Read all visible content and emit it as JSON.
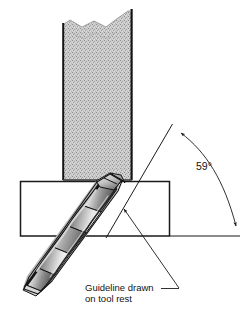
{
  "figure": {
    "background_color": "#ffffff",
    "line_color": "#1a1a1a"
  },
  "grinding_wheel": {
    "name": "grinding wheel",
    "fill_color": "#c9c9c9",
    "edge_color": "#1a1a1a",
    "left_x": 62,
    "right_x": 133,
    "top_y": 8,
    "bottom_y": 180,
    "texture": "stipple"
  },
  "tool_rest": {
    "name": "tool rest",
    "label": "",
    "left_x": 20,
    "right_x": 170,
    "top_y": 181,
    "bottom_y": 236,
    "fill_color": "#ffffff",
    "edge_color": "#1a1a1a"
  },
  "drill": {
    "name": "twist drill",
    "body_light": "#f2f2f2",
    "body_mid": "#9a9a9a",
    "body_dark": "#4a4a4a",
    "flute_edge": "#141414",
    "tip_x": 113,
    "tip_y": 175,
    "shank_x": 23,
    "shank_y": 288
  },
  "baseline": {
    "name": "horizontal reference line",
    "x1": 170,
    "y1": 236,
    "x2": 240,
    "y2": 236
  },
  "guideline": {
    "name": "guideline drawn on tool rest",
    "x1": 106,
    "y1": 237,
    "x2": 172,
    "y2": 124
  },
  "angle": {
    "value": "59°",
    "apex_x": 172,
    "apex_y": 124,
    "arc_start_x": 181,
    "arc_start_y": 133,
    "arc_end_x": 238,
    "arc_end_y": 231,
    "label_x": 196,
    "label_y": 170
  },
  "callout": {
    "line1": "Guideline drawn",
    "line2": "on tool rest",
    "text_x": 85,
    "line1_y": 291,
    "line2_y": 302,
    "leader_from_x": 179,
    "leader_from_y": 289,
    "leader_to_x": 123,
    "leader_to_y": 208,
    "tail_x": 162,
    "tail_y": 289
  }
}
